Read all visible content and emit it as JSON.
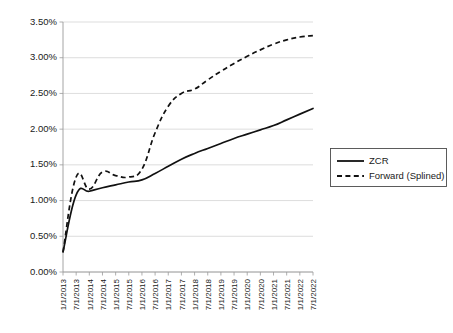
{
  "chart_data": {
    "type": "line",
    "title": "",
    "xlabel": "",
    "ylabel": "",
    "ylim": [
      0.0,
      3.5
    ],
    "ytick_values": [
      0.0,
      0.5,
      1.0,
      1.5,
      2.0,
      2.5,
      3.0,
      3.5
    ],
    "ytick_labels": [
      "0.00%",
      "0.50%",
      "1.00%",
      "1.50%",
      "2.00%",
      "2.50%",
      "3.00%",
      "3.50%"
    ],
    "grid": true,
    "legend_position": "right",
    "categories": [
      "1/1/2013",
      "7/1/2013",
      "1/1/2014",
      "7/1/2014",
      "1/1/2015",
      "7/1/2015",
      "1/1/2016",
      "7/1/2016",
      "1/1/2017",
      "7/1/2017",
      "1/1/2018",
      "7/1/2018",
      "1/1/2019",
      "7/1/2019",
      "1/1/2020",
      "7/1/2020",
      "1/1/2021",
      "7/1/2021",
      "1/1/2022",
      "7/1/2022"
    ],
    "series": [
      {
        "name": "ZCR",
        "style": "solid",
        "color": "#111111",
        "values": [
          0.28,
          1.08,
          1.13,
          1.18,
          1.22,
          1.26,
          1.29,
          1.38,
          1.48,
          1.58,
          1.66,
          1.73,
          1.8,
          1.87,
          1.93,
          1.99,
          2.05,
          2.13,
          2.21,
          2.29
        ]
      },
      {
        "name": "Forward (Splined)",
        "style": "dashed",
        "color": "#111111",
        "values": [
          0.28,
          1.33,
          1.16,
          1.4,
          1.35,
          1.33,
          1.44,
          1.95,
          2.32,
          2.5,
          2.56,
          2.69,
          2.81,
          2.92,
          3.02,
          3.11,
          3.19,
          3.25,
          3.29,
          3.31
        ]
      }
    ]
  },
  "legend": {
    "entries": [
      {
        "label": "ZCR",
        "style": "solid"
      },
      {
        "label": "Forward (Splined)",
        "style": "dashed"
      }
    ]
  }
}
